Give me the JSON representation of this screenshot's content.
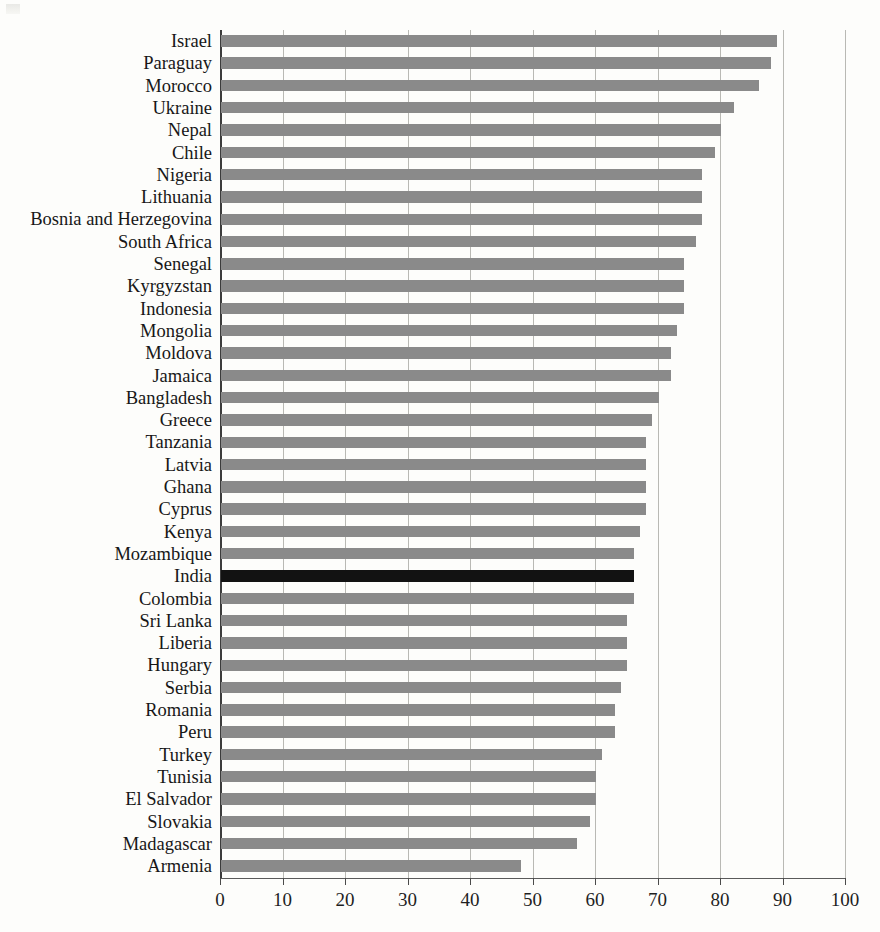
{
  "chart_data": {
    "type": "bar",
    "orientation": "horizontal",
    "title": "",
    "xlabel": "",
    "ylabel": "",
    "xlim": [
      0,
      100
    ],
    "xticks": [
      0,
      10,
      20,
      30,
      40,
      50,
      60,
      70,
      80,
      90,
      100
    ],
    "grid": true,
    "legend": "none",
    "highlight_category": "India",
    "colors": {
      "bar": "#8a8a8a",
      "highlight": "#121212",
      "grid": "#b9b9b4",
      "axis": "#3c3c3c"
    },
    "categories": [
      "Israel",
      "Paraguay",
      "Morocco",
      "Ukraine",
      "Nepal",
      "Chile",
      "Nigeria",
      "Lithuania",
      "Bosnia and Herzegovina",
      "South Africa",
      "Senegal",
      "Kyrgyzstan",
      "Indonesia",
      "Mongolia",
      "Moldova",
      "Jamaica",
      "Bangladesh",
      "Greece",
      "Tanzania",
      "Latvia",
      "Ghana",
      "Cyprus",
      "Kenya",
      "Mozambique",
      "India",
      "Colombia",
      "Sri Lanka",
      "Liberia",
      "Hungary",
      "Serbia",
      "Romania",
      "Peru",
      "Turkey",
      "Tunisia",
      "El Salvador",
      "Slovakia",
      "Madagascar",
      "Armenia"
    ],
    "values": [
      89,
      88,
      86,
      82,
      80,
      79,
      77,
      77,
      77,
      76,
      74,
      74,
      74,
      73,
      72,
      72,
      70,
      69,
      68,
      68,
      68,
      68,
      67,
      66,
      66,
      66,
      65,
      65,
      65,
      64,
      63,
      63,
      61,
      60,
      60,
      59,
      57,
      48
    ]
  }
}
